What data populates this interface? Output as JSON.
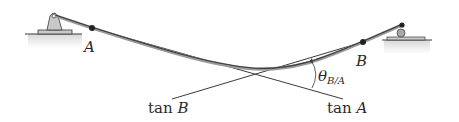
{
  "diagram": {
    "labels": {
      "point_a": "A",
      "point_b": "B",
      "tan_b_prefix": "tan ",
      "tan_b_var": "B",
      "tan_a_prefix": "tan ",
      "tan_a_var": "A",
      "theta_symbol": "θ",
      "theta_subscript": "B/A"
    },
    "supports": {
      "left": "pin-support",
      "right": "roller-support"
    },
    "colors": {
      "line": "#3a3a3a",
      "beam_highlight": "#9a9a9a",
      "support_fill": "#c9c9c9",
      "ground_shade": "#e2e2e2",
      "text": "#2b2b2b"
    }
  }
}
